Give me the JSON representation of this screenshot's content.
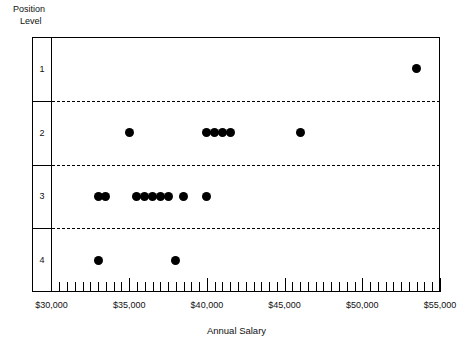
{
  "axes": {
    "y_caption_line1": "Position",
    "y_caption_line2": "Level",
    "x_title": "Annual Salary",
    "row_labels": [
      "1",
      "2",
      "3",
      "4"
    ],
    "x_tick_labels": [
      "$30,000",
      "$35,000",
      "$40,000",
      "$45,000",
      "$50,000",
      "$55,000"
    ]
  },
  "colors": {
    "axis": "#000000",
    "marker": "#000000",
    "background": "#ffffff",
    "gridline": "#000000"
  },
  "chart_data": {
    "type": "scatter",
    "title": "",
    "xlabel": "Annual Salary",
    "ylabel": "Position Level",
    "xlim": [
      30000,
      55000
    ],
    "x_tick_values": [
      30000,
      35000,
      40000,
      45000,
      50000,
      55000
    ],
    "x_minor_tick_step": 500,
    "y_categories": [
      "1",
      "2",
      "3",
      "4"
    ],
    "grid": "horizontal dashed band separators",
    "legend": "none",
    "points": [
      {
        "level": "1",
        "salary": 53500
      },
      {
        "level": "2",
        "salary": 35000
      },
      {
        "level": "2",
        "salary": 40000
      },
      {
        "level": "2",
        "salary": 40500
      },
      {
        "level": "2",
        "salary": 41000
      },
      {
        "level": "2",
        "salary": 41500
      },
      {
        "level": "2",
        "salary": 46000
      },
      {
        "level": "3",
        "salary": 33000
      },
      {
        "level": "3",
        "salary": 33500
      },
      {
        "level": "3",
        "salary": 35500
      },
      {
        "level": "3",
        "salary": 36000
      },
      {
        "level": "3",
        "salary": 36500
      },
      {
        "level": "3",
        "salary": 37000
      },
      {
        "level": "3",
        "salary": 37500
      },
      {
        "level": "3",
        "salary": 38500
      },
      {
        "level": "3",
        "salary": 40000
      },
      {
        "level": "4",
        "salary": 33000
      },
      {
        "level": "4",
        "salary": 38000
      }
    ]
  }
}
